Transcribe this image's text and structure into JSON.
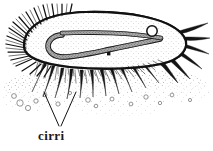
{
  "figure": {
    "style": "pen-and-ink stipple line drawing",
    "background_color": "#ffffff",
    "ink_color": "#1a1a1a"
  },
  "labels": [
    {
      "id": "cirri",
      "text": "cirri",
      "x": 38,
      "y": 128,
      "leader": "v-shaped double leader line pointing up to two cirri"
    }
  ],
  "anatomy": {
    "cell_body": "elongated oval cell body seen in side view",
    "adoral_cilia": "dense spiky membranelle fringe along left and upper-left margin",
    "ventral_cilia": "fine short cilia fringe along lower margin",
    "cirri": "stout tapered leg-like cirri projecting downward to substrate",
    "caudal_cirri": "long pointed cirri radiating to the right",
    "macronucleus": "J-shaped stippled band inside the cell",
    "micronucleus": "small dark dot below the macronucleus",
    "contractile_vacuole": "small open circle on the macronucleus at right",
    "substrate": "stippled debris field with small open circles below the cell"
  },
  "colors": {
    "ink": "#1a1a1a",
    "stipple": "#444444",
    "background": "#ffffff"
  }
}
